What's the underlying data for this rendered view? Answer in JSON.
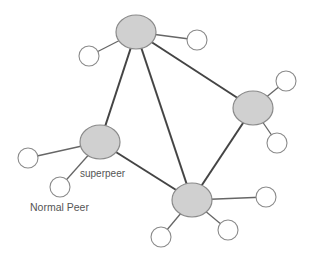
{
  "diagram": {
    "labels": {
      "superpeer": "superpeer",
      "normal_peer": "Normal Peer"
    },
    "colors": {
      "superpeer_fill": "#d0d0d0",
      "superpeer_stroke": "#8a8a8a",
      "normal_fill": "#ffffff",
      "normal_stroke": "#8a8a8a",
      "superpeer_link": "#444444",
      "peer_link": "#666666"
    },
    "superpeers": [
      {
        "id": "S1",
        "cx": 136,
        "cy": 32
      },
      {
        "id": "S2",
        "cx": 253,
        "cy": 108
      },
      {
        "id": "S3",
        "cx": 100,
        "cy": 142
      },
      {
        "id": "S4",
        "cx": 192,
        "cy": 200
      }
    ],
    "normal_peers": [
      {
        "id": "N1",
        "cx": 89,
        "cy": 56,
        "parent": "S1"
      },
      {
        "id": "N2",
        "cx": 197,
        "cy": 40,
        "parent": "S1"
      },
      {
        "id": "N3",
        "cx": 286,
        "cy": 81,
        "parent": "S2"
      },
      {
        "id": "N4",
        "cx": 277,
        "cy": 143,
        "parent": "S2"
      },
      {
        "id": "N5",
        "cx": 28,
        "cy": 158,
        "parent": "S3"
      },
      {
        "id": "N6",
        "cx": 60,
        "cy": 187,
        "parent": "S3"
      },
      {
        "id": "N7",
        "cx": 266,
        "cy": 197,
        "parent": "S4"
      },
      {
        "id": "N8",
        "cx": 228,
        "cy": 230,
        "parent": "S4"
      },
      {
        "id": "N9",
        "cx": 161,
        "cy": 237,
        "parent": "S4"
      }
    ],
    "superpeer_links": [
      [
        "S1",
        "S2"
      ],
      [
        "S1",
        "S3"
      ],
      [
        "S1",
        "S4"
      ],
      [
        "S2",
        "S4"
      ],
      [
        "S3",
        "S4"
      ]
    ]
  }
}
